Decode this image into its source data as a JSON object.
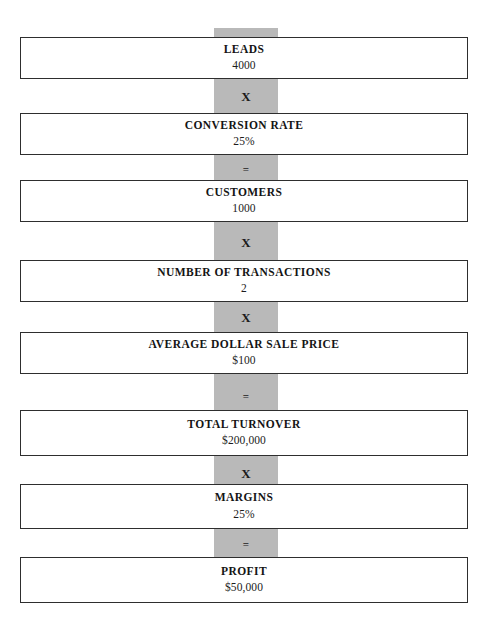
{
  "diagram": {
    "spine_color": "#b9b9b9",
    "box_border_color": "#2e2e2e",
    "background_color": "#ffffff",
    "nodes": [
      {
        "label": "LEADS",
        "value": "4000"
      },
      {
        "label": "CONVERSION RATE",
        "value": "25%"
      },
      {
        "label": "CUSTOMERS",
        "value": "1000"
      },
      {
        "label": "NUMBER OF TRANSACTIONS",
        "value": "2"
      },
      {
        "label": "AVERAGE DOLLAR SALE PRICE",
        "value": "$100"
      },
      {
        "label": "TOTAL TURNOVER",
        "value": "$200,000"
      },
      {
        "label": "MARGINS",
        "value": "25%"
      },
      {
        "label": "PROFIT",
        "value": "$50,000"
      }
    ],
    "operators": [
      {
        "symbol": "X",
        "kind": "multiply"
      },
      {
        "symbol": "=",
        "kind": "equals"
      },
      {
        "symbol": "X",
        "kind": "multiply"
      },
      {
        "symbol": "X",
        "kind": "multiply"
      },
      {
        "symbol": "=",
        "kind": "equals"
      },
      {
        "symbol": "X",
        "kind": "multiply"
      },
      {
        "symbol": "=",
        "kind": "equals"
      }
    ]
  }
}
